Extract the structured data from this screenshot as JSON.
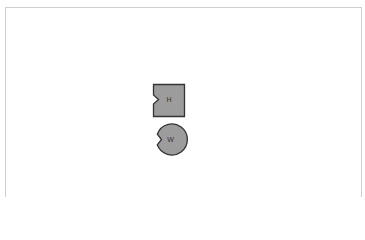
{
  "canvas": {
    "background": "#ffffff",
    "border_color": "#cfcfcf"
  },
  "shapes": [
    {
      "type": "notched-square",
      "label": "H",
      "fill": "#9c9c9c",
      "stroke": "#333333",
      "notch_side": "left"
    },
    {
      "type": "notched-circle",
      "label": "W",
      "fill": "#9c9c9c",
      "stroke": "#333333",
      "notch_side": "left"
    }
  ]
}
